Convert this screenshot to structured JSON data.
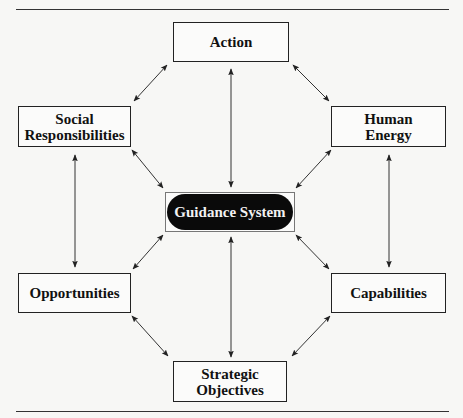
{
  "diagram": {
    "center": {
      "label": "Guidance System"
    },
    "nodes": {
      "action": {
        "label": "Action"
      },
      "social": {
        "line1": "Social",
        "line2": "Responsibilities"
      },
      "human": {
        "line1": "Human",
        "line2": "Energy"
      },
      "opportunities": {
        "label": "Opportunities"
      },
      "capabilities": {
        "label": "Capabilities"
      },
      "strategic": {
        "line1": "Strategic",
        "line2": "Objectives"
      }
    },
    "edges": [
      {
        "from": "Action",
        "to": "Social Responsibilities",
        "type": "bidirectional"
      },
      {
        "from": "Action",
        "to": "Human Energy",
        "type": "bidirectional"
      },
      {
        "from": "Action",
        "to": "Guidance System",
        "type": "bidirectional"
      },
      {
        "from": "Social Responsibilities",
        "to": "Guidance System",
        "type": "bidirectional"
      },
      {
        "from": "Human Energy",
        "to": "Guidance System",
        "type": "bidirectional"
      },
      {
        "from": "Social Responsibilities",
        "to": "Opportunities",
        "type": "bidirectional"
      },
      {
        "from": "Human Energy",
        "to": "Capabilities",
        "type": "bidirectional"
      },
      {
        "from": "Guidance System",
        "to": "Opportunities",
        "type": "bidirectional"
      },
      {
        "from": "Guidance System",
        "to": "Capabilities",
        "type": "bidirectional"
      },
      {
        "from": "Guidance System",
        "to": "Strategic Objectives",
        "type": "bidirectional"
      },
      {
        "from": "Opportunities",
        "to": "Strategic Objectives",
        "type": "bidirectional"
      },
      {
        "from": "Capabilities",
        "to": "Strategic Objectives",
        "type": "bidirectional"
      }
    ],
    "colors": {
      "line": "#222222",
      "center_fill": "#0a0a0a",
      "center_text": "#f2f2f2"
    }
  }
}
